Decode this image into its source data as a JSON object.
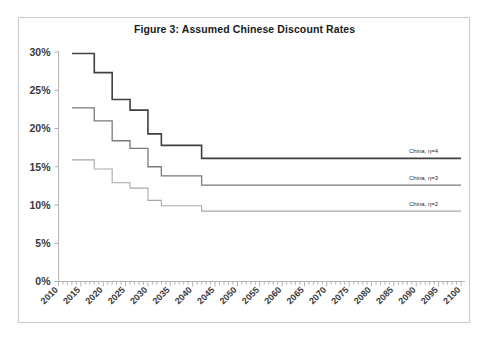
{
  "figure": {
    "title": "Figure 3: Assumed Chinese Discount Rates"
  },
  "chart_data": {
    "type": "line",
    "title": "Figure 3: Assumed Chinese Discount Rates",
    "xlabel": "",
    "ylabel": "",
    "xlim": [
      2010,
      2100
    ],
    "ylim": [
      0,
      0.3
    ],
    "ytick_labels": [
      "0%",
      "5%",
      "10%",
      "15%",
      "20%",
      "25%",
      "30%"
    ],
    "ytick_values": [
      0,
      5,
      10,
      15,
      20,
      25,
      30
    ],
    "xtick_labels": [
      "2010",
      "2015",
      "2020",
      "2025",
      "2030",
      "2035",
      "2040",
      "2045",
      "2050",
      "2055",
      "2060",
      "2065",
      "2070",
      "2075",
      "2080",
      "2085",
      "2090",
      "2095",
      "2100"
    ],
    "xtick_values": [
      2010,
      2015,
      2020,
      2025,
      2030,
      2035,
      2040,
      2045,
      2050,
      2055,
      2060,
      2065,
      2070,
      2075,
      2080,
      2085,
      2090,
      2095,
      2100
    ],
    "x_minor_tick_interval": 1,
    "grid": false,
    "legend_position": "inline-right-of-series",
    "step_style": "post",
    "series": [
      {
        "name": "China, η=4",
        "label": "China, η=4",
        "color": "#404040",
        "linewidth": 1.6,
        "x": [
          2013,
          2017,
          2018,
          2021,
          2022,
          2025,
          2026,
          2029,
          2030,
          2032,
          2033,
          2036,
          2037,
          2041,
          2042,
          2100
        ],
        "y": [
          29.8,
          29.8,
          27.3,
          27.3,
          23.8,
          23.8,
          22.4,
          22.4,
          19.3,
          19.3,
          17.8,
          17.8,
          17.8,
          17.8,
          16.1,
          16.1
        ],
        "plateau_value": 16.1,
        "start_value": 29.8
      },
      {
        "name": "China, η=3",
        "label": "China, η=3",
        "color": "#7a7a7a",
        "linewidth": 1.3,
        "x": [
          2013,
          2017,
          2018,
          2021,
          2022,
          2025,
          2026,
          2029,
          2030,
          2032,
          2033,
          2036,
          2037,
          2041,
          2042,
          2100
        ],
        "y": [
          22.7,
          22.7,
          21.0,
          21.0,
          18.4,
          18.4,
          17.4,
          17.4,
          15.0,
          15.0,
          13.8,
          13.8,
          13.8,
          13.8,
          12.6,
          12.6
        ],
        "plateau_value": 12.6,
        "start_value": 22.7
      },
      {
        "name": "China, η=2",
        "label": "China, η=2",
        "color": "#a8a8a8",
        "linewidth": 1.1,
        "x": [
          2013,
          2017,
          2018,
          2021,
          2022,
          2025,
          2026,
          2029,
          2030,
          2032,
          2033,
          2036,
          2037,
          2041,
          2042,
          2100
        ],
        "y": [
          15.9,
          15.9,
          14.7,
          14.7,
          12.9,
          12.9,
          12.2,
          12.2,
          10.6,
          10.6,
          9.9,
          9.9,
          9.9,
          9.9,
          9.2,
          9.2
        ],
        "plateau_value": 9.2,
        "start_value": 15.9
      }
    ]
  }
}
